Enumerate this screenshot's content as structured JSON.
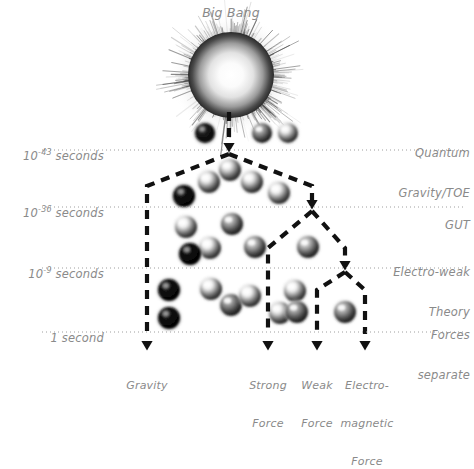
{
  "diagram": {
    "title": "Big Bang",
    "background_color": "#ffffff",
    "text_color": "#8a8a8a",
    "line_color": "#111111"
  },
  "timeline_labels": [
    {
      "id": "t1",
      "base": "10",
      "exp": "-43",
      "unit": " seconds",
      "y": 150
    },
    {
      "id": "t2",
      "base": "10",
      "exp": "-36",
      "unit": " seconds",
      "y": 207
    },
    {
      "id": "t3",
      "base": "10",
      "exp": "-9",
      "unit": " seconds",
      "y": 268
    },
    {
      "id": "t4",
      "base": "1",
      "exp": "",
      "unit": " second",
      "y": 332
    }
  ],
  "era_labels": [
    {
      "id": "e1",
      "line1": "Quantum",
      "line2": "Gravity/TOE"
    },
    {
      "id": "e2",
      "line1": "GUT",
      "line2": ""
    },
    {
      "id": "e3",
      "line1": "Electro-weak",
      "line2": "Theory"
    },
    {
      "id": "e4",
      "line1": "Forces",
      "line2": "separate"
    }
  ],
  "force_labels": [
    {
      "id": "f1",
      "line1": "Gravity",
      "line2": "",
      "line3": ""
    },
    {
      "id": "f2",
      "line1": "Strong",
      "line2": "Force",
      "line3": ""
    },
    {
      "id": "f3",
      "line1": "Weak",
      "line2": "Force",
      "line3": ""
    },
    {
      "id": "f4",
      "line1": "Electro-",
      "line2": "magnetic",
      "line3": "Force"
    }
  ],
  "chart_data": {
    "type": "diagram",
    "title": "Big Bang",
    "dotted_lines_y": [
      150,
      207,
      268,
      332
    ],
    "branch_nodes": [
      {
        "x": 229,
        "y": 150,
        "label": "Quantum Gravity/TOE split"
      },
      {
        "x": 312,
        "y": 207,
        "label": "GUT split"
      },
      {
        "x": 345,
        "y": 268,
        "label": "Electro-weak split"
      }
    ],
    "terminal_arrows_x": [
      147,
      268,
      317,
      365
    ],
    "particles": [
      {
        "x": 205,
        "y": 133,
        "r": 10,
        "shade": 0.12
      },
      {
        "x": 262,
        "y": 133,
        "r": 10,
        "shade": 0.62
      },
      {
        "x": 288,
        "y": 133,
        "r": 10,
        "shade": 0.9
      },
      {
        "x": 230,
        "y": 170,
        "r": 11,
        "shade": 0.88
      },
      {
        "x": 209,
        "y": 182,
        "r": 11,
        "shade": 0.92
      },
      {
        "x": 252,
        "y": 182,
        "r": 11,
        "shade": 0.9
      },
      {
        "x": 279,
        "y": 193,
        "r": 11,
        "shade": 0.93
      },
      {
        "x": 184,
        "y": 196,
        "r": 11,
        "shade": 0.08
      },
      {
        "x": 186,
        "y": 227,
        "r": 11,
        "shade": 0.93
      },
      {
        "x": 232,
        "y": 224,
        "r": 11,
        "shade": 0.66
      },
      {
        "x": 210,
        "y": 248,
        "r": 11,
        "shade": 0.94
      },
      {
        "x": 255,
        "y": 247,
        "r": 11,
        "shade": 0.7
      },
      {
        "x": 308,
        "y": 247,
        "r": 11,
        "shade": 0.72
      },
      {
        "x": 190,
        "y": 254,
        "r": 11,
        "shade": 0.06
      },
      {
        "x": 169,
        "y": 290,
        "r": 11,
        "shade": 0.07
      },
      {
        "x": 211,
        "y": 289,
        "r": 11,
        "shade": 0.93
      },
      {
        "x": 231,
        "y": 305,
        "r": 11,
        "shade": 0.6
      },
      {
        "x": 250,
        "y": 296,
        "r": 11,
        "shade": 0.94
      },
      {
        "x": 280,
        "y": 313,
        "r": 11,
        "shade": 0.9
      },
      {
        "x": 169,
        "y": 318,
        "r": 11,
        "shade": 0.07
      },
      {
        "x": 295,
        "y": 291,
        "r": 11,
        "shade": 0.93
      },
      {
        "x": 297,
        "y": 312,
        "r": 11,
        "shade": 0.62
      },
      {
        "x": 345,
        "y": 312,
        "r": 11,
        "shade": 0.66
      }
    ]
  }
}
